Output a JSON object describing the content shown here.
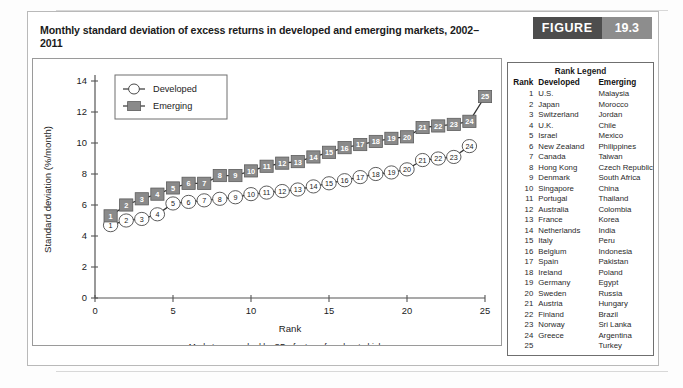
{
  "figure": {
    "title": "Monthly standard deviation of excess returns in developed and emerging markets, 2002–2011",
    "badge_label": "FIGURE",
    "badge_number": "19.3"
  },
  "legend_panel": {
    "title": "Rank Legend",
    "columns": [
      "Rank",
      "Developed",
      "Emerging"
    ],
    "rows": [
      {
        "rank": "1",
        "developed": "U.S.",
        "emerging": "Malaysia"
      },
      {
        "rank": "2",
        "developed": "Japan",
        "emerging": "Morocco"
      },
      {
        "rank": "3",
        "developed": "Switzerland",
        "emerging": "Jordan"
      },
      {
        "rank": "4",
        "developed": "U.K.",
        "emerging": "Chile"
      },
      {
        "rank": "5",
        "developed": "Israel",
        "emerging": "Mexico"
      },
      {
        "rank": "6",
        "developed": "New Zealand",
        "emerging": "Philippines"
      },
      {
        "rank": "7",
        "developed": "Canada",
        "emerging": "Taiwan"
      },
      {
        "rank": "8",
        "developed": "Hong Kong",
        "emerging": "Czech Republic"
      },
      {
        "rank": "9",
        "developed": "Denmark",
        "emerging": "South Africa"
      },
      {
        "rank": "10",
        "developed": "Singapore",
        "emerging": "China"
      },
      {
        "rank": "11",
        "developed": "Portugal",
        "emerging": "Thailand"
      },
      {
        "rank": "12",
        "developed": "Australia",
        "emerging": "Colombia"
      },
      {
        "rank": "13",
        "developed": "France",
        "emerging": "Korea"
      },
      {
        "rank": "14",
        "developed": "Netherlands",
        "emerging": "India"
      },
      {
        "rank": "15",
        "developed": "Italy",
        "emerging": "Peru"
      },
      {
        "rank": "16",
        "developed": "Belgium",
        "emerging": "Indonesia"
      },
      {
        "rank": "17",
        "developed": "Spain",
        "emerging": "Pakistan"
      },
      {
        "rank": "18",
        "developed": "Ireland",
        "emerging": "Poland"
      },
      {
        "rank": "19",
        "developed": "Germany",
        "emerging": "Egypt"
      },
      {
        "rank": "20",
        "developed": "Sweden",
        "emerging": "Russia"
      },
      {
        "rank": "21",
        "developed": "Austria",
        "emerging": "Hungary"
      },
      {
        "rank": "22",
        "developed": "Finland",
        "emerging": "Brazil"
      },
      {
        "rank": "23",
        "developed": "Norway",
        "emerging": "Sri Lanka"
      },
      {
        "rank": "24",
        "developed": "Greece",
        "emerging": "Argentina"
      },
      {
        "rank": "25",
        "developed": "",
        "emerging": "Turkey"
      }
    ]
  },
  "chart_data": {
    "type": "line",
    "title": "",
    "xlabel": "Rank",
    "ylabel": "Standard deviation (%/month)",
    "caption": "Markets are ranked by SD of return, from low to high",
    "xlim": [
      0,
      25
    ],
    "ylim": [
      0,
      14
    ],
    "xticks": [
      0,
      5,
      10,
      15,
      20,
      25
    ],
    "yticks": [
      0,
      2,
      4,
      6,
      8,
      10,
      12,
      14
    ],
    "grid": false,
    "legend_position": "top-left",
    "series": [
      {
        "name": "Developed",
        "marker": "open-circle",
        "color": "#ffffff",
        "line_color": "#333333",
        "x": [
          1,
          2,
          3,
          4,
          5,
          6,
          7,
          8,
          9,
          10,
          11,
          12,
          13,
          14,
          15,
          16,
          17,
          18,
          19,
          20,
          21,
          22,
          23,
          24
        ],
        "values": [
          4.7,
          5.0,
          5.1,
          5.4,
          6.1,
          6.2,
          6.3,
          6.4,
          6.5,
          6.7,
          6.8,
          6.9,
          7.0,
          7.2,
          7.4,
          7.6,
          7.8,
          8.0,
          8.1,
          8.3,
          8.9,
          9.0,
          9.1,
          9.8
        ]
      },
      {
        "name": "Emerging",
        "marker": "filled-square",
        "color": "#8a8a8a",
        "line_color": "#333333",
        "x": [
          1,
          2,
          3,
          4,
          5,
          6,
          7,
          8,
          9,
          10,
          11,
          12,
          13,
          14,
          15,
          16,
          17,
          18,
          19,
          20,
          21,
          22,
          23,
          24,
          25
        ],
        "values": [
          5.3,
          6.0,
          6.4,
          6.7,
          7.1,
          7.4,
          7.4,
          7.9,
          7.9,
          8.2,
          8.5,
          8.7,
          8.8,
          9.1,
          9.4,
          9.7,
          9.9,
          10.1,
          10.3,
          10.4,
          11.0,
          11.1,
          11.2,
          11.4,
          13.0
        ]
      }
    ]
  }
}
